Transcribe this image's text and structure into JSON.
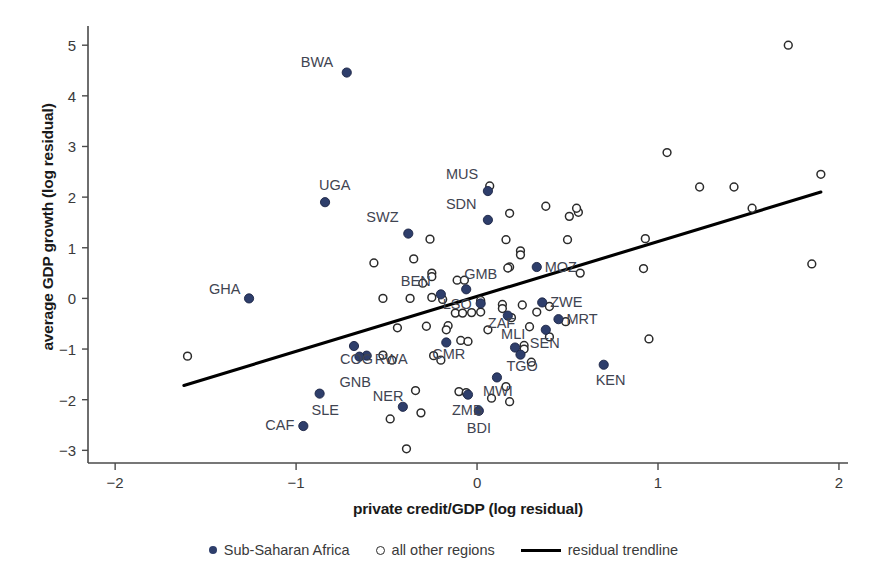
{
  "chart_data": {
    "type": "scatter",
    "title": "",
    "xlabel": "private credit/GDP (log residual)",
    "ylabel": "average GDP growth (log residual)",
    "xlim": [
      -2.15,
      2.05
    ],
    "ylim": [
      -3.25,
      5.3
    ],
    "xticks": [
      -2,
      -1,
      0,
      1,
      2
    ],
    "yticks": [
      -3,
      -2,
      -1,
      0,
      1,
      2,
      3,
      4,
      5
    ],
    "xtick_labels": [
      "−2",
      "−1",
      "0",
      "1",
      "2"
    ],
    "ytick_labels": [
      "−3",
      "−2",
      "−1",
      "0",
      "1",
      "2",
      "3",
      "4",
      "5"
    ],
    "grid": false,
    "legend_position": "bottom",
    "colors": {
      "sub_saharan_marker": "#2e3e6b",
      "other_marker_stroke": "#2b2b2b",
      "trendline": "#000000",
      "label_text": "#3f4451",
      "axis": "#4a4a4a"
    },
    "series": [
      {
        "name": "Sub-Saharan Africa",
        "marker": "filled-circle",
        "points": [
          {
            "label": "BWA",
            "x": -0.72,
            "y": 4.46,
            "label_dx": -46,
            "label_dy": -6
          },
          {
            "label": "UGA",
            "x": -0.84,
            "y": 1.9,
            "label_dx": -6,
            "label_dy": -12
          },
          {
            "label": "GHA",
            "x": -1.26,
            "y": 0.0,
            "label_dx": -40,
            "label_dy": -4
          },
          {
            "label": "SWZ",
            "x": -0.38,
            "y": 1.28,
            "label_dx": -42,
            "label_dy": -12
          },
          {
            "label": "MUS",
            "x": 0.06,
            "y": 2.12,
            "label_dx": -42,
            "label_dy": -12
          },
          {
            "label": "SDN",
            "x": 0.06,
            "y": 1.55,
            "label_dx": -42,
            "label_dy": -11
          },
          {
            "label": "MOZ",
            "x": 0.33,
            "y": 0.62,
            "label_dx": 8,
            "label_dy": 5
          },
          {
            "label": "BEN",
            "x": -0.2,
            "y": 0.08,
            "label_dx": -40,
            "label_dy": -8
          },
          {
            "label": "GMB",
            "x": -0.06,
            "y": 0.18,
            "label_dx": -2,
            "label_dy": -10
          },
          {
            "label": "LSO",
            "x": 0.02,
            "y": -0.1,
            "label_dx": -38,
            "label_dy": 6
          },
          {
            "label": "ZWE",
            "x": 0.36,
            "y": -0.08,
            "label_dx": 8,
            "label_dy": 5
          },
          {
            "label": "ZAF",
            "x": 0.17,
            "y": -0.34,
            "label_dx": -20,
            "label_dy": 12
          },
          {
            "label": "MRT",
            "x": 0.45,
            "y": -0.41,
            "label_dx": 8,
            "label_dy": 5
          },
          {
            "label": "MLI",
            "x": 0.21,
            "y": -0.97,
            "label_dx": -14,
            "label_dy": -9
          },
          {
            "label": "SEN",
            "x": 0.38,
            "y": -0.62,
            "label_dx": -16,
            "label_dy": 18
          },
          {
            "label": "CMR",
            "x": -0.17,
            "y": -0.87,
            "label_dx": -14,
            "label_dy": 17
          },
          {
            "label": "TGO",
            "x": 0.24,
            "y": -1.11,
            "label_dx": -14,
            "label_dy": 16
          },
          {
            "label": "KEN",
            "x": 0.7,
            "y": -1.31,
            "label_dx": -8,
            "label_dy": 20
          },
          {
            "label": "COG",
            "x": -0.68,
            "y": -0.94,
            "label_dx": -14,
            "label_dy": 18
          },
          {
            "label": "RWA",
            "x": -0.61,
            "y": -1.13,
            "label_dx": 8,
            "label_dy": 8
          },
          {
            "label": "GNB",
            "x": -0.65,
            "y": -1.15,
            "label_dx": -20,
            "label_dy": 30
          },
          {
            "label": "MWI",
            "x": 0.11,
            "y": -1.56,
            "label_dx": -14,
            "label_dy": 19
          },
          {
            "label": "SLE",
            "x": -0.87,
            "y": -1.88,
            "label_dx": -8,
            "label_dy": 21
          },
          {
            "label": "NER",
            "x": -0.41,
            "y": -2.14,
            "label_dx": -30,
            "label_dy": -6
          },
          {
            "label": "ZMB",
            "x": -0.05,
            "y": -1.9,
            "label_dx": -16,
            "label_dy": 20
          },
          {
            "label": "BDI",
            "x": 0.01,
            "y": -2.22,
            "label_dx": -12,
            "label_dy": 22
          },
          {
            "label": "CAF",
            "x": -0.96,
            "y": -2.52,
            "label_dx": -38,
            "label_dy": 4
          }
        ]
      },
      {
        "name": "all other regions",
        "marker": "open-circle",
        "points": [
          {
            "x": 1.72,
            "y": 5.0
          },
          {
            "x": 1.05,
            "y": 2.88
          },
          {
            "x": 0.07,
            "y": 2.22
          },
          {
            "x": 1.23,
            "y": 2.2
          },
          {
            "x": 1.42,
            "y": 2.2
          },
          {
            "x": 1.9,
            "y": 2.45
          },
          {
            "x": 0.18,
            "y": 1.68
          },
          {
            "x": 0.38,
            "y": 1.82
          },
          {
            "x": 0.51,
            "y": 1.62
          },
          {
            "x": 0.56,
            "y": 1.7
          },
          {
            "x": 0.55,
            "y": 1.78
          },
          {
            "x": 1.52,
            "y": 1.78
          },
          {
            "x": -0.26,
            "y": 1.17
          },
          {
            "x": 0.16,
            "y": 1.16
          },
          {
            "x": 0.5,
            "y": 1.16
          },
          {
            "x": 0.93,
            "y": 1.18
          },
          {
            "x": 0.24,
            "y": 0.94
          },
          {
            "x": 0.24,
            "y": 0.86
          },
          {
            "x": -0.57,
            "y": 0.7
          },
          {
            "x": -0.35,
            "y": 0.78
          },
          {
            "x": 1.85,
            "y": 0.68
          },
          {
            "x": -0.25,
            "y": 0.5
          },
          {
            "x": -0.25,
            "y": 0.43
          },
          {
            "x": 0.18,
            "y": 0.62
          },
          {
            "x": 0.17,
            "y": 0.6
          },
          {
            "x": 0.57,
            "y": 0.5
          },
          {
            "x": 0.92,
            "y": 0.59
          },
          {
            "x": -0.3,
            "y": 0.3
          },
          {
            "x": -0.11,
            "y": 0.36
          },
          {
            "x": -0.07,
            "y": 0.36
          },
          {
            "x": -0.52,
            "y": 0.0
          },
          {
            "x": -0.37,
            "y": 0.0
          },
          {
            "x": -0.19,
            "y": -0.02
          },
          {
            "x": -0.25,
            "y": 0.02
          },
          {
            "x": 0.02,
            "y": -0.04
          },
          {
            "x": 0.14,
            "y": -0.12
          },
          {
            "x": 0.14,
            "y": -0.2
          },
          {
            "x": 0.25,
            "y": -0.13
          },
          {
            "x": 0.4,
            "y": -0.16
          },
          {
            "x": -0.12,
            "y": -0.29
          },
          {
            "x": -0.08,
            "y": -0.29
          },
          {
            "x": -0.03,
            "y": -0.28
          },
          {
            "x": 0.02,
            "y": -0.27
          },
          {
            "x": 0.33,
            "y": -0.27
          },
          {
            "x": 0.19,
            "y": -0.38
          },
          {
            "x": 0.49,
            "y": -0.46
          },
          {
            "x": -0.44,
            "y": -0.58
          },
          {
            "x": -0.28,
            "y": -0.55
          },
          {
            "x": -0.16,
            "y": -0.54
          },
          {
            "x": -0.17,
            "y": -0.62
          },
          {
            "x": 0.06,
            "y": -0.62
          },
          {
            "x": 0.29,
            "y": -0.56
          },
          {
            "x": 0.4,
            "y": -0.76
          },
          {
            "x": -0.09,
            "y": -0.83
          },
          {
            "x": -0.05,
            "y": -0.85
          },
          {
            "x": 0.26,
            "y": -0.93
          },
          {
            "x": 0.26,
            "y": -1.0
          },
          {
            "x": -1.6,
            "y": -1.14
          },
          {
            "x": -0.52,
            "y": -1.12
          },
          {
            "x": -0.47,
            "y": -1.22
          },
          {
            "x": -0.24,
            "y": -1.13
          },
          {
            "x": -0.2,
            "y": -1.22
          },
          {
            "x": 0.95,
            "y": -0.8
          },
          {
            "x": 0.3,
            "y": -1.26
          },
          {
            "x": -0.34,
            "y": -1.82
          },
          {
            "x": -0.1,
            "y": -1.84
          },
          {
            "x": -0.06,
            "y": -1.86
          },
          {
            "x": 0.08,
            "y": -1.97
          },
          {
            "x": 0.16,
            "y": -1.74
          },
          {
            "x": 0.18,
            "y": -2.04
          },
          {
            "x": -0.31,
            "y": -2.26
          },
          {
            "x": -0.48,
            "y": -2.38
          },
          {
            "x": -0.39,
            "y": -2.97
          }
        ]
      }
    ],
    "trendline": {
      "name": "residual trendline",
      "x_start": -1.62,
      "y_start": -1.72,
      "x_end": 1.9,
      "y_end": 2.1
    },
    "legend": [
      {
        "key": "sub-saharan-africa",
        "label": "Sub-Saharan Africa",
        "marker": "filled-circle"
      },
      {
        "key": "all-other-regions",
        "label": "all other regions",
        "marker": "open-circle"
      },
      {
        "key": "residual-trendline",
        "label": "residual trendline",
        "marker": "line"
      }
    ]
  }
}
